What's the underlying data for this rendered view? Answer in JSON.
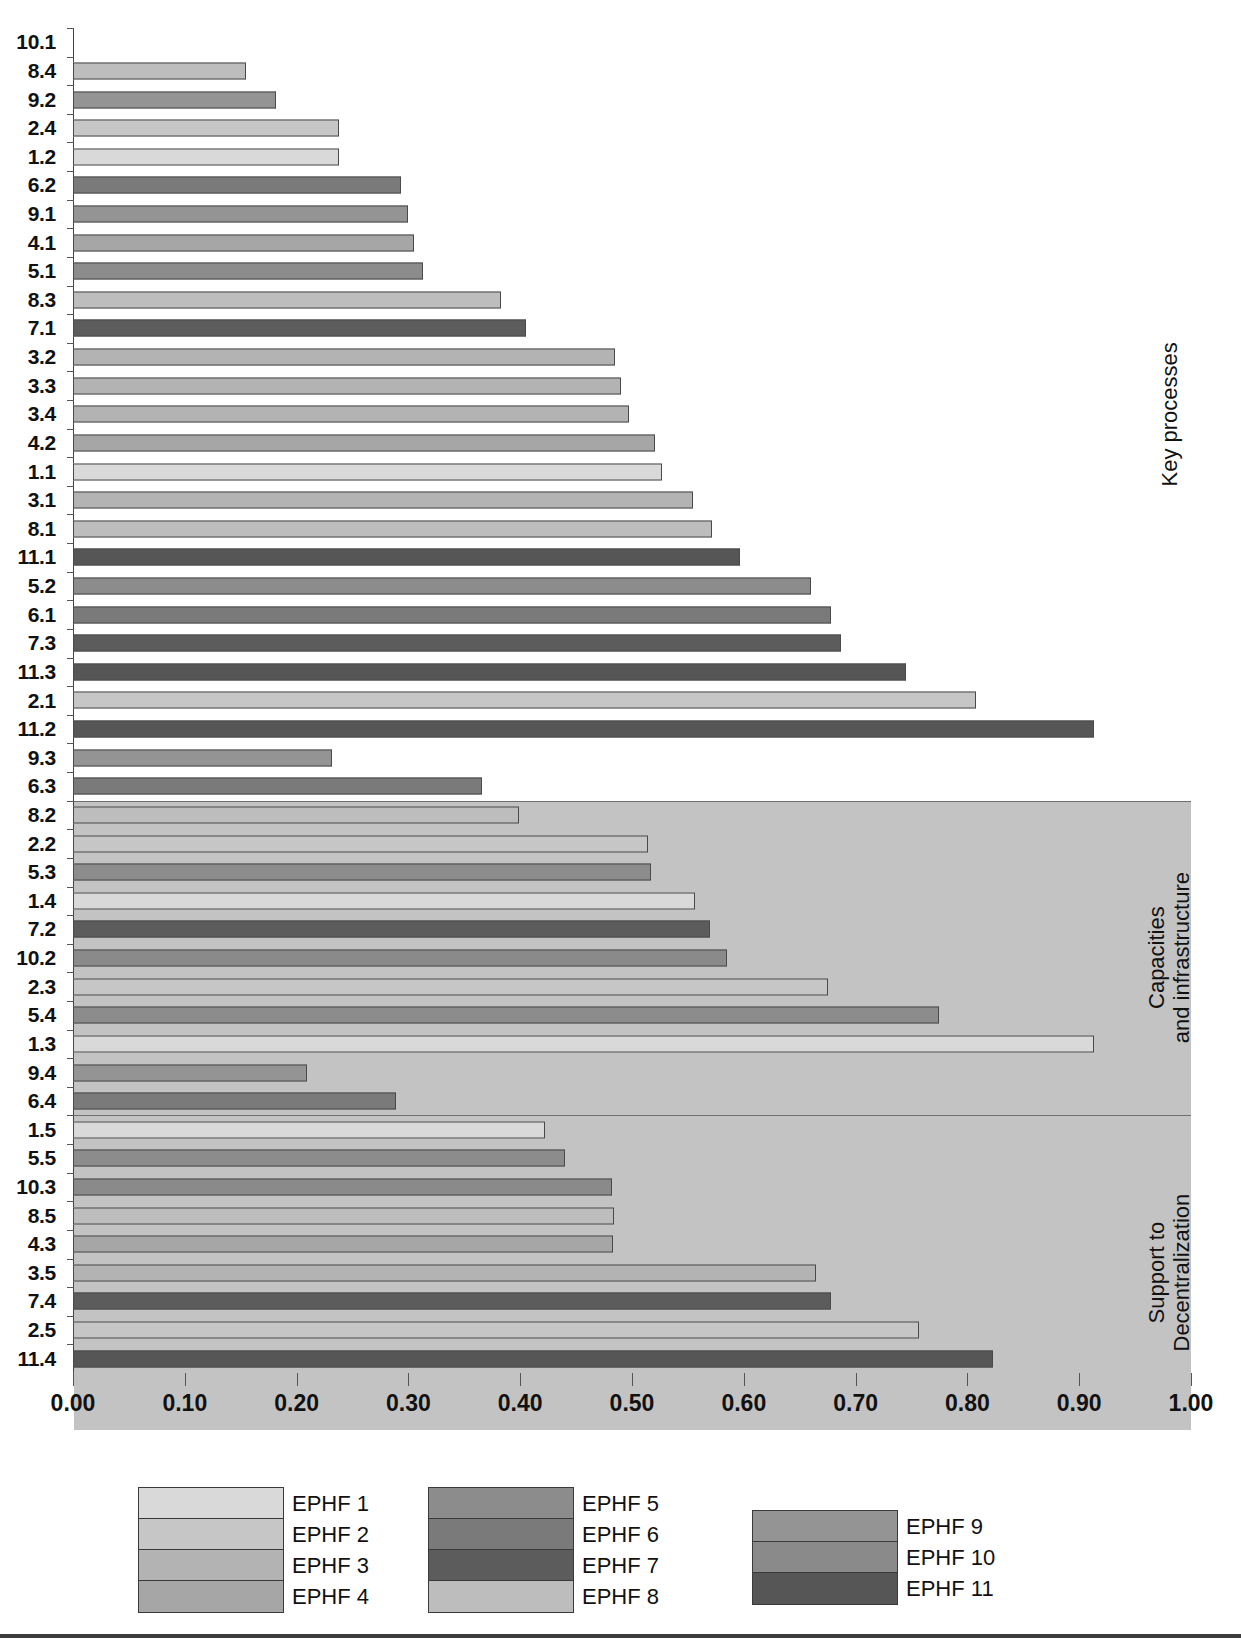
{
  "chart_data": {
    "type": "bar",
    "orientation": "horizontal",
    "title": "",
    "xlabel": "",
    "ylabel": "",
    "xlim": [
      0.0,
      1.0
    ],
    "xticks": [
      "0.00",
      "0.10",
      "0.20",
      "0.30",
      "0.40",
      "0.50",
      "0.60",
      "0.70",
      "0.80",
      "0.90",
      "1.00"
    ],
    "xtick_values": [
      0.0,
      0.1,
      0.2,
      0.3,
      0.4,
      0.5,
      0.6,
      0.7,
      0.8,
      0.9,
      1.0
    ],
    "grid": false,
    "legend_position": "bottom",
    "legend": [
      {
        "label": "EPHF 1",
        "color": "#d9d9d9"
      },
      {
        "label": "EPHF 2",
        "color": "#c6c6c6"
      },
      {
        "label": "EPHF 3",
        "color": "#b3b3b3"
      },
      {
        "label": "EPHF 4",
        "color": "#a6a6a6"
      },
      {
        "label": "EPHF 5",
        "color": "#8c8c8c"
      },
      {
        "label": "EPHF 6",
        "color": "#7a7a7a"
      },
      {
        "label": "EPHF 7",
        "color": "#5c5c5c"
      },
      {
        "label": "EPHF 8",
        "color": "#bdbdbd"
      },
      {
        "label": "EPHF 9",
        "color": "#949494"
      },
      {
        "label": "EPHF 10",
        "color": "#8a8a8a"
      },
      {
        "label": "EPHF 11",
        "color": "#565656"
      }
    ],
    "sections": [
      {
        "name": "Key processes",
        "background": "#ffffff",
        "start_index": 0,
        "count": 27
      },
      {
        "name": "Capacities\nand infrastructure",
        "background": "#c3c3c3",
        "start_index": 27,
        "count": 11
      },
      {
        "name": "Support to\nDecentralization",
        "background": "#c3c3c3",
        "start_index": 38,
        "count": 11
      }
    ],
    "categories": [
      "10.1",
      "8.4",
      "9.2",
      "2.4",
      "1.2",
      "6.2",
      "9.1",
      "4.1",
      "5.1",
      "8.3",
      "7.1",
      "3.2",
      "3.3",
      "3.4",
      "4.2",
      "1.1",
      "3.1",
      "8.1",
      "11.1",
      "5.2",
      "6.1",
      "7.3",
      "11.3",
      "2.1",
      "11.2",
      "9.3",
      "6.3",
      "8.2",
      "2.2",
      "5.3",
      "1.4",
      "7.2",
      "10.2",
      "2.3",
      "5.4",
      "1.3",
      "9.4",
      "6.4",
      "1.5",
      "5.5",
      "10.3",
      "8.5",
      "4.3",
      "3.5",
      "7.4",
      "2.5",
      "11.4"
    ],
    "values": [
      0.0,
      0.155,
      0.182,
      0.238,
      0.238,
      0.293,
      0.3,
      0.305,
      0.313,
      0.383,
      0.405,
      0.485,
      0.49,
      0.497,
      0.521,
      0.527,
      0.555,
      0.572,
      0.597,
      0.66,
      0.678,
      0.687,
      0.745,
      0.808,
      0.913,
      0.232,
      0.366,
      0.399,
      0.514,
      0.517,
      0.556,
      0.57,
      0.585,
      0.675,
      0.775,
      0.913,
      0.209,
      0.289,
      0.422,
      0.44,
      0.482,
      0.484,
      0.483,
      0.665,
      0.678,
      0.757,
      0.823
    ],
    "series_index": [
      10,
      8,
      9,
      2,
      1,
      6,
      9,
      4,
      5,
      8,
      7,
      3,
      3,
      3,
      4,
      1,
      3,
      8,
      11,
      5,
      6,
      7,
      11,
      2,
      11,
      9,
      6,
      8,
      2,
      5,
      1,
      7,
      10,
      2,
      5,
      1,
      9,
      6,
      1,
      5,
      10,
      8,
      4,
      3,
      7,
      2,
      11
    ],
    "bar_colors": [
      "#8a8a8a",
      "#bdbdbd",
      "#949494",
      "#c6c6c6",
      "#d9d9d9",
      "#7a7a7a",
      "#949494",
      "#a6a6a6",
      "#8c8c8c",
      "#bdbdbd",
      "#5c5c5c",
      "#b3b3b3",
      "#b3b3b3",
      "#b3b3b3",
      "#a6a6a6",
      "#d9d9d9",
      "#b3b3b3",
      "#bdbdbd",
      "#565656",
      "#8c8c8c",
      "#7a7a7a",
      "#5c5c5c",
      "#565656",
      "#c6c6c6",
      "#565656",
      "#949494",
      "#7a7a7a",
      "#bdbdbd",
      "#c6c6c6",
      "#8c8c8c",
      "#d9d9d9",
      "#5c5c5c",
      "#8a8a8a",
      "#c6c6c6",
      "#8c8c8c",
      "#d9d9d9",
      "#949494",
      "#7a7a7a",
      "#d9d9d9",
      "#8c8c8c",
      "#8a8a8a",
      "#bdbdbd",
      "#a6a6a6",
      "#b3b3b3",
      "#5c5c5c",
      "#c6c6c6",
      "#565656"
    ]
  },
  "legend_columns": [
    {
      "items": [
        0,
        1,
        2,
        3
      ]
    },
    {
      "items": [
        4,
        5,
        6,
        7
      ]
    },
    {
      "items": [
        8,
        9,
        10
      ]
    }
  ],
  "colors": {
    "section_shade": "#c3c3c3",
    "axis": "#555555",
    "bar_outline": "#4a4a4a",
    "text": "#111111"
  }
}
